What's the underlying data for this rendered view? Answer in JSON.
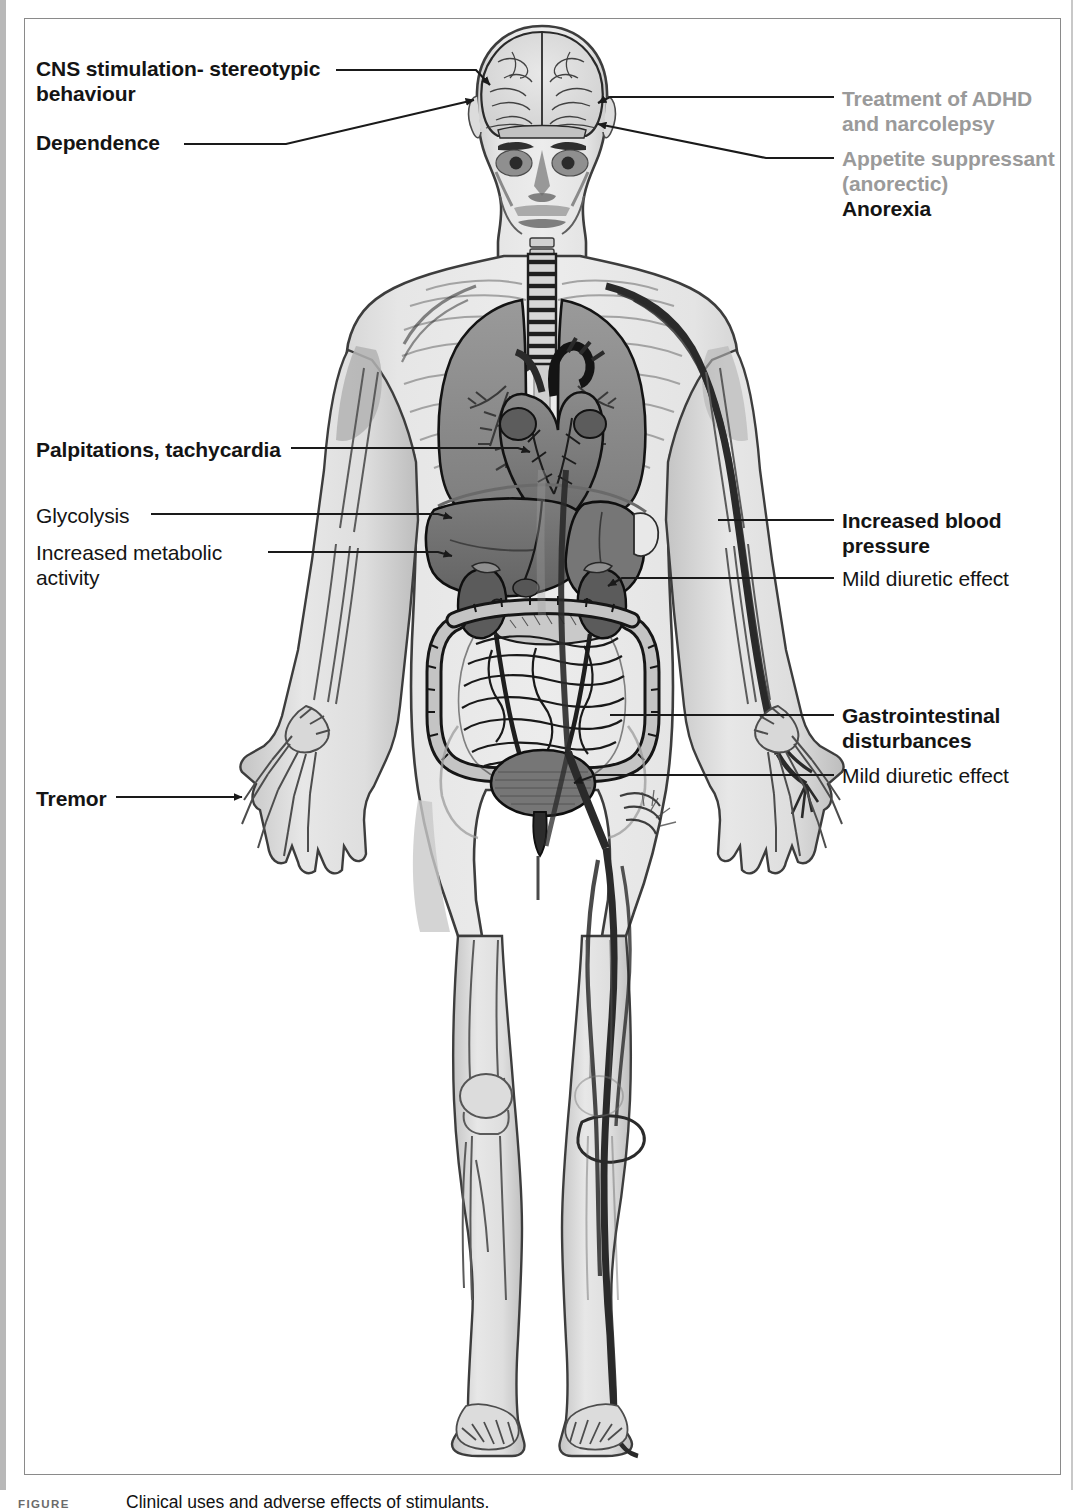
{
  "figure": {
    "number_label": "FIGURE",
    "caption": "Clinical uses and adverse effects of stimulants."
  },
  "colors": {
    "text_black": "#141414",
    "text_grey": "#9a9a9a",
    "leader_line": "#1a1a1a",
    "frame": "#8a8a8a",
    "body_fill": "#e2e2e2",
    "organ_dark": "#6e6e6e",
    "organ_mid": "#8d8d8d",
    "organ_light": "#bdbdbd",
    "vessel": "#3a3a3a"
  },
  "labels": {
    "left": [
      {
        "id": "cns-stimulation",
        "text": "CNS stimulation- stereotypic\nbehaviour",
        "weight": "bold",
        "color": "black",
        "x": 30,
        "y": 56
      },
      {
        "id": "dependence",
        "text": "Dependence",
        "weight": "bold",
        "color": "black",
        "x": 30,
        "y": 130
      },
      {
        "id": "palpitations",
        "text": "Palpitations, tachycardia",
        "weight": "bold",
        "color": "black",
        "x": 30,
        "y": 437
      },
      {
        "id": "glycolysis",
        "text": "Glycolysis",
        "weight": "normal",
        "color": "black",
        "x": 30,
        "y": 503
      },
      {
        "id": "increased-metabolic-activity",
        "text": "Increased metabolic\nactivity",
        "weight": "normal",
        "color": "black",
        "x": 30,
        "y": 540
      },
      {
        "id": "tremor",
        "text": "Tremor",
        "weight": "bold",
        "color": "black",
        "x": 30,
        "y": 786
      }
    ],
    "right": [
      {
        "id": "treatment-adhd-narcolepsy",
        "text": "Treatment of ADHD\nand narcolepsy",
        "weight": "bold",
        "color": "grey",
        "x": 836,
        "y": 86
      },
      {
        "id": "appetite-suppressant",
        "text": "Appetite suppressant\n(anorectic)",
        "weight": "bold",
        "color": "grey",
        "x": 836,
        "y": 146
      },
      {
        "id": "anorexia",
        "text": "Anorexia",
        "weight": "bold",
        "color": "black",
        "x": 836,
        "y": 196
      },
      {
        "id": "increased-blood-pressure",
        "text": "Increased blood\npressure",
        "weight": "bold",
        "color": "black",
        "x": 836,
        "y": 508
      },
      {
        "id": "mild-diuretic-effect-kidney",
        "text": "Mild diuretic effect",
        "weight": "normal",
        "color": "black",
        "x": 836,
        "y": 566
      },
      {
        "id": "gastrointestinal-disturbances",
        "text": "Gastrointestinal\ndisturbances",
        "weight": "bold",
        "color": "black",
        "x": 836,
        "y": 703
      },
      {
        "id": "mild-diuretic-effect-bladder",
        "text": "Mild diuretic effect",
        "weight": "normal",
        "color": "black",
        "x": 836,
        "y": 763
      }
    ]
  },
  "anatomy": {
    "title": "Anterior view of human body with internal organs",
    "structures": [
      "brain",
      "skull",
      "eyes",
      "trachea",
      "lungs",
      "heart",
      "liver",
      "stomach",
      "pancreas",
      "kidneys",
      "ureters",
      "bladder",
      "large-intestine",
      "small-intestine",
      "femur",
      "patella",
      "tibia",
      "fibula",
      "hand-bones",
      "foot-bones",
      "arteries",
      "veins"
    ]
  },
  "leaders": [
    {
      "id": "leader-cns-stimulation",
      "type": "arrow",
      "from_label": "cns-stimulation",
      "target": "brain-upper-left"
    },
    {
      "id": "leader-dependence",
      "type": "arrow",
      "from_label": "dependence",
      "target": "brain-lower-left"
    },
    {
      "id": "leader-treatment-adhd",
      "type": "arrow",
      "from_label": "treatment-adhd-narcolepsy",
      "target": "brain-right"
    },
    {
      "id": "leader-appetite-suppressant",
      "type": "arrow",
      "from_label": "appetite-suppressant",
      "target": "temple-right"
    },
    {
      "id": "leader-palpitations",
      "type": "arrow",
      "from_label": "palpitations",
      "target": "heart"
    },
    {
      "id": "leader-glycolysis",
      "type": "arrow",
      "from_label": "glycolysis",
      "target": "liver"
    },
    {
      "id": "leader-metabolic",
      "type": "arrow",
      "from_label": "increased-metabolic-activity",
      "target": "liver-lower"
    },
    {
      "id": "leader-blood-pressure",
      "type": "line",
      "from_label": "increased-blood-pressure",
      "target": "arm-artery"
    },
    {
      "id": "leader-diuretic-kidney",
      "type": "line",
      "from_label": "mild-diuretic-effect-kidney",
      "target": "kidney-right"
    },
    {
      "id": "leader-gi",
      "type": "line",
      "from_label": "gastrointestinal-disturbances",
      "target": "intestine"
    },
    {
      "id": "leader-diuretic-bladder",
      "type": "arrow",
      "from_label": "mild-diuretic-effect-bladder",
      "target": "bladder"
    },
    {
      "id": "leader-tremor",
      "type": "arrow",
      "from_label": "tremor",
      "target": "left-hand"
    }
  ]
}
